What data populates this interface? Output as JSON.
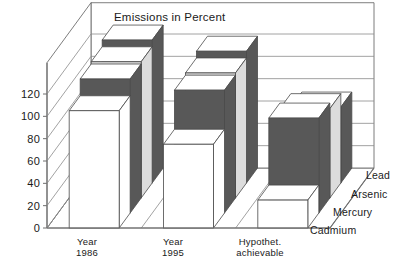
{
  "chart_data": {
    "type": "bar",
    "title": "Emissions in Percent",
    "xlabel": "",
    "ylabel": "",
    "ylim": [
      0,
      120
    ],
    "yticks": [
      0,
      20,
      40,
      60,
      80,
      100,
      120
    ],
    "grid": true,
    "projection": "3d",
    "legend_position": "right-depth-axis",
    "categories": [
      "Year 1986",
      "Year 1995",
      "Hypothet. achievable"
    ],
    "category_lines": [
      [
        "Year",
        "1986"
      ],
      [
        "Year",
        "1995"
      ],
      [
        "Hypothet.",
        "achievable"
      ]
    ],
    "series": [
      {
        "name": "Cadmium",
        "color": "#ffffff",
        "values": [
          105,
          75,
          25
        ]
      },
      {
        "name": "Mercury",
        "color": "#585858",
        "values": [
          120,
          110,
          85
        ]
      },
      {
        "name": "Arsenic",
        "color": "#dcdcdc",
        "values": [
          122,
          112,
          80
        ]
      },
      {
        "name": "Lead",
        "color": "#585858",
        "values": [
          128,
          118,
          68
        ]
      }
    ]
  },
  "axis": {
    "tick_labels": [
      "120",
      "100",
      "80",
      "60",
      "40",
      "20",
      "0"
    ]
  },
  "series_labels": [
    "Lead",
    "Arsenic",
    "Mercury",
    "Cadmium"
  ],
  "colors": {
    "ink": "#1a1a1a",
    "frame": "#6e6e6e",
    "grid": "#8a8a8a",
    "bar_white": "#ffffff",
    "bar_dark": "#585858",
    "bar_light": "#dcdcdc",
    "bar_edge": "#4a4a4a"
  }
}
